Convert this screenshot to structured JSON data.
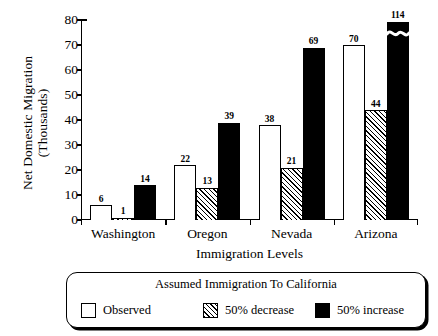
{
  "chart_data": {
    "type": "bar",
    "title": "",
    "xlabel": "Immigration Levels",
    "ylabel": "Net Domestic Migration (Thousands)",
    "ylabel_lines": [
      "Net Domestic Migration",
      "(Thousands)"
    ],
    "categories": [
      "Washington",
      "Oregon",
      "Nevada",
      "Arizona"
    ],
    "ylim": [
      0,
      80
    ],
    "yticks": [
      0,
      10,
      20,
      30,
      40,
      50,
      60,
      70,
      80
    ],
    "ytick_labels": [
      "0",
      "10",
      "20",
      "30",
      "40",
      "50",
      "60",
      "70",
      "80"
    ],
    "grid": false,
    "legend_position": "below-plot",
    "legend_title": "Assumed Immigration To California",
    "series": [
      {
        "name": "Observed",
        "fill": "white",
        "values": [
          6,
          22,
          38,
          70
        ],
        "labels": [
          "6",
          "22",
          "38",
          "70"
        ]
      },
      {
        "name": "50% decrease",
        "fill": "hatched",
        "values": [
          1,
          13,
          21,
          44
        ],
        "labels": [
          "1",
          "13",
          "21",
          "44"
        ]
      },
      {
        "name": "50% increase",
        "fill": "black",
        "values": [
          14,
          39,
          69,
          114
        ],
        "labels": [
          "14",
          "39",
          "69",
          "114"
        ],
        "clipped": [
          false,
          false,
          false,
          true
        ],
        "note": "Arizona 50% increase bar (114) exceeds the axis maximum of 80 and is drawn with a wavy axis-break marker near its top."
      }
    ],
    "annotations": [
      {
        "kind": "axis-break",
        "series": "50% increase",
        "category": "Arizona",
        "value": 114
      }
    ],
    "colors": {
      "ink": "#000000",
      "background": "#ffffff",
      "observed_fill": "#ffffff",
      "decrease_fill": "#ffffff",
      "increase_fill": "#000000"
    }
  },
  "legend": {
    "title": "Assumed Immigration To California",
    "items": [
      {
        "label": "Observed",
        "swatch": "observed"
      },
      {
        "label": "50% decrease",
        "swatch": "decrease"
      },
      {
        "label": "50% increase",
        "swatch": "increase"
      }
    ]
  }
}
